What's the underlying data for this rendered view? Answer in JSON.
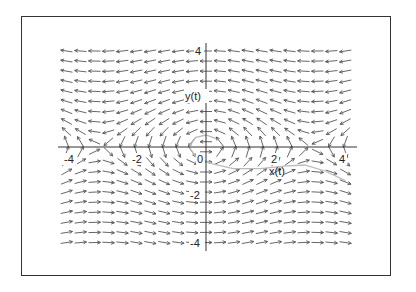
{
  "chart_data": {
    "type": "vector_field",
    "title": "",
    "xlabel": "x(t)",
    "ylabel": "y(t)",
    "xlim": [
      -4.4,
      4.5
    ],
    "ylim": [
      -4.5,
      4.5
    ],
    "x_ticks": [
      -4,
      -2,
      0,
      2,
      4
    ],
    "x_tick_labels": [
      "-4",
      "-2",
      "0",
      "2",
      "4"
    ],
    "y_ticks": [
      4,
      2,
      -2,
      -4
    ],
    "y_tick_labels": [
      "4",
      "2",
      "-2",
      "-4"
    ],
    "origin_label": "0",
    "grid": false,
    "legend": null,
    "field": {
      "description": "Direction field of a pendulum-type system; arrows point left for y>0 and right for y<0, vertical near the x-axis, saddles near x = ±π",
      "dx": "-y",
      "dy": "sin(x)",
      "x_range": [
        -4.1,
        4.2
      ],
      "y_range": [
        -4,
        4
      ],
      "x_step": 0.41,
      "y_step": 0.42
    },
    "trajectory": {
      "description": "Faint grey solution curve starting near origin, curling around it and heading right below the x-axis",
      "points": [
        [
          0.3,
          0.35
        ],
        [
          0.0,
          0.5
        ],
        [
          -0.3,
          0.4
        ],
        [
          -0.5,
          0.0
        ],
        [
          -0.3,
          -0.4
        ],
        [
          0.2,
          -0.7
        ],
        [
          0.8,
          -0.9
        ],
        [
          1.6,
          -0.9
        ],
        [
          2.3,
          -0.8
        ],
        [
          2.9,
          -0.75
        ],
        [
          3.5,
          -1.0
        ],
        [
          4.1,
          -1.4
        ]
      ]
    },
    "colors": {
      "arrows": "#555555",
      "axes": "#333333",
      "trajectory": "#bbbbbb",
      "frame": "#333333"
    }
  },
  "labels": {
    "x_axis": "x(t)",
    "y_axis": "y(t)"
  }
}
